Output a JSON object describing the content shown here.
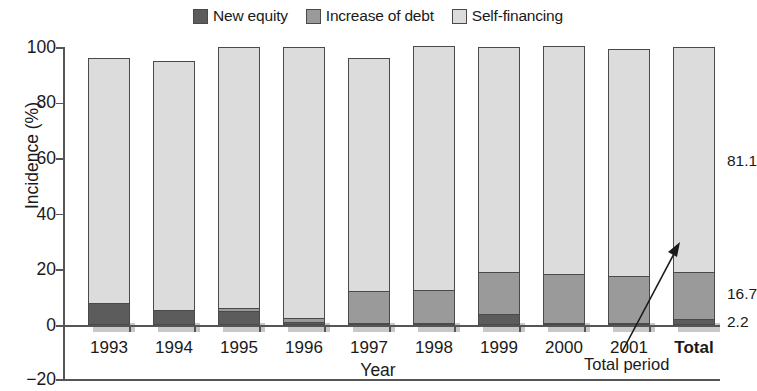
{
  "legend": {
    "items": [
      {
        "label": "New equity",
        "color": "#5c5c5c",
        "icon": "square-swatch-icon"
      },
      {
        "label": "Increase of debt",
        "color": "#9a9a9a",
        "icon": "square-swatch-icon"
      },
      {
        "label": "Self-financing",
        "color": "#dcdcdc",
        "icon": "square-swatch-icon"
      }
    ]
  },
  "axes": {
    "y_title": "Incidence (%)",
    "x_title": "Year",
    "y_ticks": [
      "100",
      "80",
      "60",
      "40",
      "20",
      "0",
      "−20"
    ]
  },
  "annotation": {
    "text": "Total period",
    "arrow": "callout-arrow-icon"
  },
  "right_labels": [
    {
      "value": "81.1",
      "series": "Self-financing"
    },
    {
      "value": "16.7",
      "series": "Increase of debt"
    },
    {
      "value": "2.2",
      "series": "New equity"
    }
  ],
  "chart_data": {
    "type": "bar",
    "stacked": true,
    "title": "",
    "xlabel": "Year",
    "ylabel": "Incidence (%)",
    "ylim": [
      -20,
      100
    ],
    "yticks": [
      -20,
      0,
      20,
      40,
      60,
      80,
      100
    ],
    "grid": false,
    "legend_position": "top-center",
    "categories": [
      "1993",
      "1994",
      "1995",
      "1996",
      "1997",
      "1998",
      "1999",
      "2000",
      "2001",
      "Total"
    ],
    "series": [
      {
        "name": "New equity",
        "color": "#5c5c5c",
        "values": [
          8.0,
          5.5,
          5.0,
          1.0,
          0.5,
          0.5,
          4.0,
          0.5,
          0.5,
          2.2
        ]
      },
      {
        "name": "Increase of debt",
        "color": "#9a9a9a",
        "values": [
          0.0,
          0.0,
          1.0,
          1.5,
          11.5,
          12.0,
          15.0,
          17.5,
          17.0,
          16.7
        ]
      },
      {
        "name": "Self-financing",
        "color": "#dcdcdc",
        "values": [
          88.0,
          89.5,
          94.0,
          97.5,
          84.0,
          87.5,
          81.0,
          82.0,
          81.5,
          81.1
        ]
      }
    ],
    "totals": [
      96.0,
      95.0,
      100.0,
      100.0,
      96.0,
      100.0,
      100.0,
      100.0,
      99.0,
      100.0
    ],
    "data_labels": {
      "Total": {
        "New equity": "2.2",
        "Increase of debt": "16.7",
        "Self-financing": "81.1"
      }
    },
    "annotations": [
      {
        "text": "Total period",
        "points_to": "Total"
      }
    ]
  }
}
